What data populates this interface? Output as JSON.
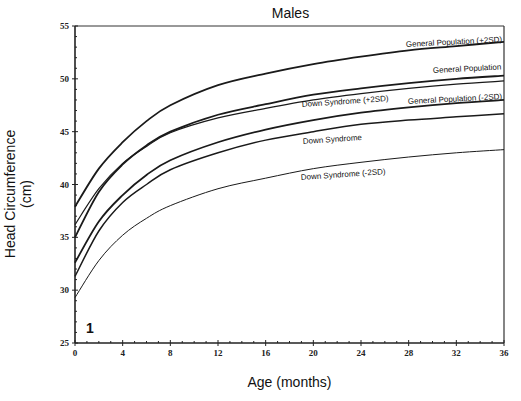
{
  "chart_data": {
    "type": "line",
    "title": "Males",
    "xlabel": "Age (months)",
    "ylabel": "Head Circumference (cm)",
    "xlim": [
      0,
      36
    ],
    "ylim": [
      25,
      55
    ],
    "x_ticks": [
      0,
      4,
      8,
      12,
      16,
      20,
      24,
      28,
      32,
      36
    ],
    "y_ticks": [
      25,
      30,
      35,
      40,
      45,
      50,
      55
    ],
    "grid": false,
    "legend": "inline labels at right",
    "panel_label": "1",
    "x": [
      0,
      2,
      4,
      6,
      8,
      12,
      16,
      20,
      24,
      28,
      32,
      36
    ],
    "series": [
      {
        "name": "General Population (+2SD)",
        "values": [
          37.9,
          41.5,
          44.0,
          46.0,
          47.5,
          49.4,
          50.5,
          51.4,
          52.1,
          52.7,
          53.1,
          53.5
        ]
      },
      {
        "name": "General Population",
        "values": [
          35.0,
          39.3,
          41.9,
          43.7,
          45.0,
          46.6,
          47.6,
          48.5,
          49.1,
          49.6,
          50.0,
          50.3
        ]
      },
      {
        "name": "Down Syndrome (+2SD)",
        "values": [
          36.2,
          39.6,
          42.0,
          43.6,
          44.9,
          46.3,
          47.2,
          48.0,
          48.6,
          49.1,
          49.5,
          49.8
        ]
      },
      {
        "name": "General Population (-2SD)",
        "values": [
          32.6,
          36.5,
          39.0,
          40.9,
          42.3,
          44.0,
          45.2,
          46.1,
          46.8,
          47.3,
          47.7,
          48.0
        ]
      },
      {
        "name": "Down Syndrome",
        "values": [
          31.3,
          35.6,
          38.3,
          40.0,
          41.4,
          43.0,
          44.2,
          45.0,
          45.7,
          46.1,
          46.4,
          46.7
        ]
      },
      {
        "name": "Down Syndrome (-2SD)",
        "values": [
          29.3,
          32.8,
          35.2,
          36.8,
          38.0,
          39.6,
          40.6,
          41.5,
          42.1,
          42.6,
          43.0,
          43.3
        ]
      }
    ]
  },
  "labels": {
    "title": "Males",
    "xlabel": "Age (months)",
    "ylabel": "Head Circumference (cm)",
    "panel": "1",
    "series": [
      "General Population (+2SD)",
      "General Population",
      "Down Syndrome (+2SD)",
      "General Population (-2SD)",
      "Down Syndrome",
      "Down Syndrome (-2SD)"
    ]
  }
}
